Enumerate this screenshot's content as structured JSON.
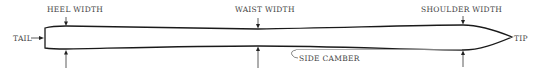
{
  "diagram": {
    "labels": {
      "tail": "TAIL",
      "tip": "TIP",
      "heel_width": "HEEL WIDTH",
      "waist_width": "WAIST WIDTH",
      "shoulder_width": "SHOULDER WIDTH",
      "side_camber": "SIDE CAMBER"
    },
    "colors": {
      "outline": "#1a1a1a",
      "text": "#444444",
      "camber_line": "#9a9a9a",
      "background": "#ffffff"
    }
  }
}
